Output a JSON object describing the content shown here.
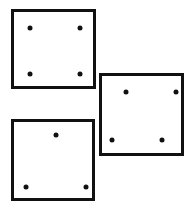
{
  "colors": {
    "stroke": "#111111",
    "background": "#ffffff"
  },
  "boxes": [
    {
      "name": "box-four-dots-top-left",
      "x": 11,
      "y": 9,
      "w": 85,
      "h": 80,
      "dots": [
        [
          16,
          16
        ],
        [
          66,
          16
        ],
        [
          16,
          62
        ],
        [
          66,
          62
        ]
      ]
    },
    {
      "name": "box-four-dots-right",
      "x": 99,
      "y": 73,
      "w": 85,
      "h": 83,
      "dots": [
        [
          24,
          16
        ],
        [
          74,
          16
        ],
        [
          10,
          64
        ],
        [
          60,
          64
        ]
      ]
    },
    {
      "name": "box-three-dots-bottom-left",
      "x": 11,
      "y": 119,
      "w": 84,
      "h": 82,
      "dots": [
        [
          42,
          13
        ],
        [
          12,
          65
        ],
        [
          72,
          65
        ]
      ]
    }
  ]
}
